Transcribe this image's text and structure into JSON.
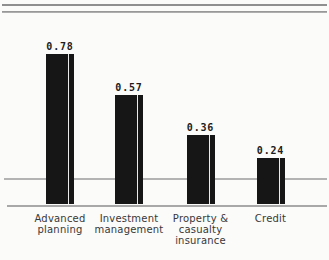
{
  "chart_data": {
    "type": "bar",
    "title": "",
    "xlabel": "",
    "ylabel": "",
    "categories": [
      "Advanced planning",
      "Investment management",
      "Property & casualty insurance",
      "Credit"
    ],
    "category_lines": [
      [
        "Advanced",
        "planning"
      ],
      [
        "Investment",
        "management"
      ],
      [
        "Property &",
        "casualty",
        "insurance"
      ],
      [
        "Credit"
      ]
    ],
    "values": [
      0.78,
      0.57,
      0.36,
      0.24
    ],
    "data_labels": [
      "0.78",
      "0.57",
      "0.36",
      "0.24"
    ],
    "ylim": [
      0,
      0.8
    ],
    "legend": "none",
    "grid": "one horizontal gridline crossing bars, plus baseline under bars",
    "bar_color": "#161616",
    "bar_stripe_color": "#eaeaea",
    "gridline_color": "#b3b3b3",
    "baseline_color": "#a8a8a8",
    "top_rule_color": "#8f8f8f"
  }
}
